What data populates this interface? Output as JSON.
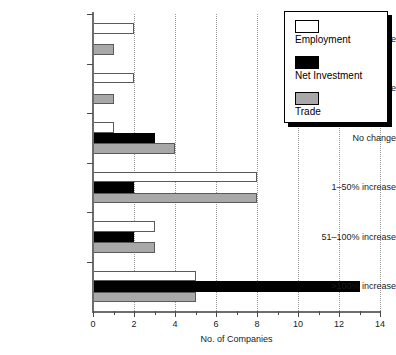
{
  "chart_data": {
    "type": "bar",
    "orientation": "horizontal",
    "title": "",
    "xlabel": "No. of Companies",
    "ylabel": "",
    "xlim": [
      0,
      14
    ],
    "ylim": null,
    "grid": "vertical-dotted",
    "legend_position": "top-right",
    "categories": [
      "51–100% decrease",
      "1–50% decrease",
      "No change",
      "1–50% increase",
      "51–100% increase",
      ">100% increase"
    ],
    "xticks": [
      0,
      2,
      4,
      6,
      8,
      10,
      12,
      14
    ],
    "xtick_labels": [
      "0",
      "2",
      "4",
      "6",
      "8",
      "10",
      "12",
      "14"
    ],
    "xticks_minor": [
      1,
      3,
      5,
      7,
      9,
      11,
      13
    ],
    "series": [
      {
        "name": "Employment",
        "color": "#ffffff",
        "edge_color": "#5a5a5a",
        "values": [
          2,
          2,
          1,
          8,
          3,
          5
        ]
      },
      {
        "name": "Net Investment",
        "color": "#000000",
        "edge_color": "#000000",
        "values": [
          0,
          0,
          3,
          2,
          2,
          13
        ]
      },
      {
        "name": "Trade",
        "color": "#a8a8a8",
        "edge_color": "#5a5a5a",
        "values": [
          1,
          1,
          4,
          8,
          3,
          5
        ]
      }
    ]
  },
  "legend": {
    "items": [
      {
        "label": "Employment",
        "swatch": "employment"
      },
      {
        "label": "Net Investment",
        "swatch": "netinv"
      },
      {
        "label": "Trade",
        "swatch": "trade"
      }
    ]
  },
  "axis": {
    "x_title": "No. of Companies"
  }
}
